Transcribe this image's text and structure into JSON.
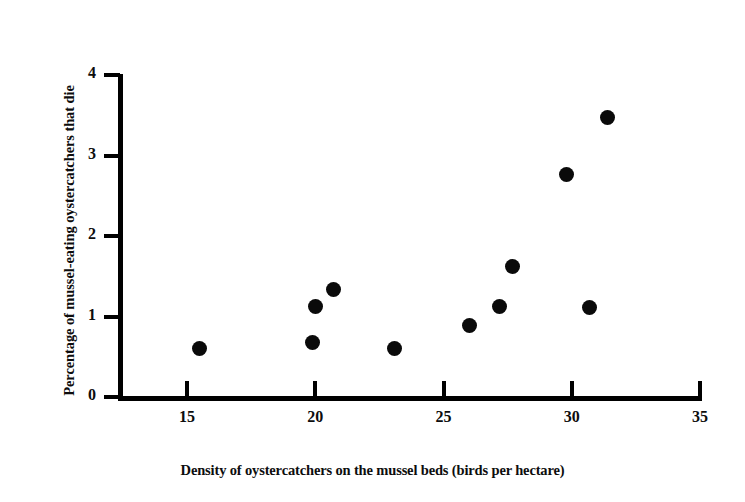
{
  "chart_data": {
    "type": "scatter",
    "title": "",
    "xlabel": "Density of oystercatchers on the mussel beds (birds per hectare)",
    "ylabel": "Percentage of mussel-eating oystercatchers that die",
    "xlim": [
      13,
      36
    ],
    "ylim": [
      0,
      4.15
    ],
    "xticks": [
      15,
      20,
      25,
      30,
      35
    ],
    "yticks": [
      0,
      1,
      2,
      3,
      4
    ],
    "xtick_labels": [
      "15",
      "20",
      "25",
      "30",
      "35"
    ],
    "ytick_labels": [
      "0",
      "1",
      "2",
      "3",
      "4"
    ],
    "grid": false,
    "legend": false,
    "marker": "filled-circle",
    "marker_color": "#0a0a0a",
    "axis_color": "#000000",
    "background_color": "#ffffff",
    "points": [
      {
        "x": 15.5,
        "y": 0.6
      },
      {
        "x": 19.9,
        "y": 0.68
      },
      {
        "x": 20.0,
        "y": 1.12
      },
      {
        "x": 20.7,
        "y": 1.34
      },
      {
        "x": 23.1,
        "y": 0.6
      },
      {
        "x": 26.0,
        "y": 0.89
      },
      {
        "x": 27.2,
        "y": 1.12
      },
      {
        "x": 27.7,
        "y": 1.62
      },
      {
        "x": 29.8,
        "y": 2.76
      },
      {
        "x": 30.7,
        "y": 1.11
      },
      {
        "x": 31.4,
        "y": 3.47
      }
    ]
  }
}
